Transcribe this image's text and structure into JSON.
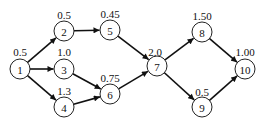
{
  "diagram": {
    "type": "directed-network",
    "nodes": [
      {
        "id": "1",
        "x": 20,
        "y": 69,
        "weight": "0.5",
        "wx": 20,
        "wy": 52
      },
      {
        "id": "2",
        "x": 64,
        "y": 31,
        "weight": "0.5",
        "wx": 64,
        "wy": 15
      },
      {
        "id": "3",
        "x": 64,
        "y": 69,
        "weight": "1.0",
        "wx": 64,
        "wy": 52
      },
      {
        "id": "4",
        "x": 64,
        "y": 107,
        "weight": "1.3",
        "wx": 64,
        "wy": 91
      },
      {
        "id": "5",
        "x": 110,
        "y": 30,
        "weight": "0.45",
        "wx": 110,
        "wy": 14
      },
      {
        "id": "6",
        "x": 110,
        "y": 94,
        "weight": "0.75",
        "wx": 110,
        "wy": 78
      },
      {
        "id": "7",
        "x": 157,
        "y": 66,
        "weight": "2.0",
        "wx": 155,
        "wy": 52
      },
      {
        "id": "8",
        "x": 202,
        "y": 32,
        "weight": "1.50",
        "wx": 202,
        "wy": 16
      },
      {
        "id": "9",
        "x": 202,
        "y": 107,
        "weight": "0.5",
        "wx": 202,
        "wy": 92
      },
      {
        "id": "10",
        "x": 245,
        "y": 69,
        "weight": "1.00",
        "wx": 245,
        "wy": 52
      }
    ],
    "edges": [
      {
        "from": "1",
        "to": "2"
      },
      {
        "from": "1",
        "to": "3"
      },
      {
        "from": "1",
        "to": "4"
      },
      {
        "from": "2",
        "to": "5"
      },
      {
        "from": "3",
        "to": "6"
      },
      {
        "from": "4",
        "to": "6"
      },
      {
        "from": "5",
        "to": "7"
      },
      {
        "from": "6",
        "to": "7"
      },
      {
        "from": "7",
        "to": "8"
      },
      {
        "from": "7",
        "to": "9"
      },
      {
        "from": "8",
        "to": "10"
      },
      {
        "from": "9",
        "to": "10"
      }
    ],
    "node_radius": 10
  }
}
